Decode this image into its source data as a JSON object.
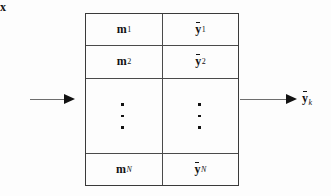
{
  "figure": {
    "type": "block-diagram"
  },
  "input": {
    "label": "x",
    "symbol": "x",
    "bar": false,
    "subscript": ""
  },
  "output": {
    "label": "ȳ_k",
    "symbol": "y",
    "bar": true,
    "subscript": "k"
  },
  "table": {
    "columns": [
      {
        "name": "memory-keys"
      },
      {
        "name": "memory-values"
      }
    ],
    "rows": [
      {
        "left": {
          "symbol": "m",
          "bar": false,
          "subscript": "1"
        },
        "right": {
          "symbol": "y",
          "bar": true,
          "subscript": "1"
        }
      },
      {
        "left": {
          "symbol": "m",
          "bar": false,
          "subscript": "2"
        },
        "right": {
          "symbol": "y",
          "bar": true,
          "subscript": "2"
        }
      },
      {
        "left": {
          "symbol": "⋮",
          "bar": false,
          "subscript": ""
        },
        "right": {
          "symbol": "⋮",
          "bar": false,
          "subscript": ""
        }
      },
      {
        "left": {
          "symbol": "m",
          "bar": false,
          "subscript": "N"
        },
        "right": {
          "symbol": "y",
          "bar": true,
          "subscript": "N"
        }
      }
    ]
  },
  "colors": {
    "ink": "#121212",
    "rule": "#4a4a4a",
    "arrow": "#6d6d6d",
    "background": "#fdfdfd"
  }
}
